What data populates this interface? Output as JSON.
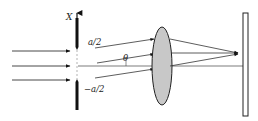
{
  "diagram": {
    "labels": {
      "axis": "X",
      "upper_edge": "a/2",
      "lower_edge": "−a/2",
      "angle": "θ"
    },
    "colors": {
      "stroke": "#222222",
      "slit": "#111111",
      "lens_fill": "#c8c8c8",
      "screen_fill": "#ffffff"
    },
    "elements": [
      "incident-plane-wave-arrows",
      "slit-with-aperture",
      "x-axis-arrow",
      "diffracted-rays-at-angle-theta",
      "converging-lens",
      "observation-screen",
      "optical-axis"
    ]
  }
}
